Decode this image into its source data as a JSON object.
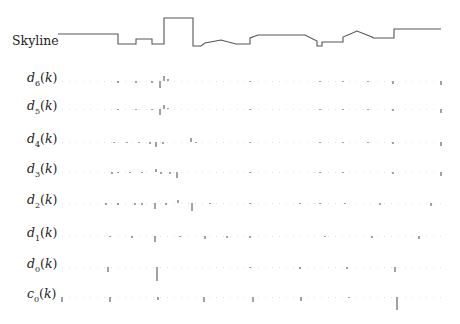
{
  "figure": {
    "skyline_label": "Skyline",
    "rows": [
      {
        "key": "d6",
        "base": "d",
        "sub": "6",
        "arg": "(k)",
        "y": 81
      },
      {
        "key": "d5",
        "base": "d",
        "sub": "5",
        "arg": "(k)",
        "y": 109
      },
      {
        "key": "d4",
        "base": "d",
        "sub": "4",
        "arg": "(k)",
        "y": 142
      },
      {
        "key": "d3",
        "base": "d",
        "sub": "3",
        "arg": "(k)",
        "y": 172
      },
      {
        "key": "d2",
        "base": "d",
        "sub": "2",
        "arg": "(k)",
        "y": 203
      },
      {
        "key": "d1",
        "base": "d",
        "sub": "1",
        "arg": "(k)",
        "y": 236
      },
      {
        "key": "d0",
        "base": "d",
        "sub": "0",
        "arg": "(k)",
        "y": 267
      },
      {
        "key": "c0",
        "base": "c",
        "sub": "0",
        "arg": "(k)",
        "y": 297
      }
    ]
  },
  "chart_data": {
    "type": "line",
    "title": "",
    "skyline": [
      [
        58,
        34
      ],
      [
        118,
        34
      ],
      [
        118,
        44
      ],
      [
        136,
        44
      ],
      [
        136,
        39
      ],
      [
        152,
        39
      ],
      [
        152,
        44
      ],
      [
        164,
        44
      ],
      [
        164,
        18
      ],
      [
        193,
        18
      ],
      [
        193,
        46
      ],
      [
        201,
        46
      ],
      [
        205,
        43
      ],
      [
        221,
        40
      ],
      [
        236,
        44
      ],
      [
        250,
        44
      ],
      [
        250,
        38
      ],
      [
        258,
        35
      ],
      [
        305,
        35
      ],
      [
        317,
        41
      ],
      [
        317,
        46
      ],
      [
        322,
        46
      ],
      [
        322,
        42
      ],
      [
        343,
        42
      ],
      [
        343,
        37
      ],
      [
        357,
        31
      ],
      [
        372,
        37
      ],
      [
        373,
        38
      ],
      [
        394,
        38
      ],
      [
        394,
        29
      ],
      [
        441,
        29
      ]
    ],
    "stems": {
      "d6": [
        [
          118,
          -2
        ],
        [
          136,
          -2
        ],
        [
          152,
          -2
        ],
        [
          160,
          -7
        ],
        [
          164,
          5
        ],
        [
          168,
          2
        ],
        [
          250,
          -1
        ],
        [
          320,
          -1
        ],
        [
          343,
          -1
        ],
        [
          368,
          -1
        ],
        [
          393,
          -3
        ],
        [
          441,
          -4
        ]
      ],
      "d5": [
        [
          118,
          -1
        ],
        [
          136,
          -1
        ],
        [
          152,
          -1
        ],
        [
          160,
          -6
        ],
        [
          164,
          4
        ],
        [
          168,
          1
        ],
        [
          250,
          -1
        ],
        [
          320,
          -1
        ],
        [
          343,
          -1
        ],
        [
          368,
          -1
        ],
        [
          393,
          -2
        ],
        [
          441,
          -4
        ]
      ],
      "d4": [
        [
          114,
          -1
        ],
        [
          127,
          -1
        ],
        [
          139,
          -1
        ],
        [
          150,
          -2
        ],
        [
          156,
          -5
        ],
        [
          163,
          -2
        ],
        [
          191,
          4
        ],
        [
          196,
          -1
        ],
        [
          250,
          -1
        ],
        [
          320,
          -1
        ],
        [
          343,
          -1
        ],
        [
          368,
          -1
        ],
        [
          393,
          -2
        ],
        [
          441,
          -4
        ]
      ],
      "d3": [
        [
          112,
          -2
        ],
        [
          118,
          -1
        ],
        [
          130,
          -1
        ],
        [
          142,
          -1
        ],
        [
          156,
          3
        ],
        [
          161,
          -2
        ],
        [
          170,
          -2
        ],
        [
          177,
          -6
        ],
        [
          250,
          -1
        ],
        [
          320,
          -1
        ],
        [
          343,
          -1
        ],
        [
          393,
          -2
        ],
        [
          441,
          -4
        ]
      ],
      "d2": [
        [
          106,
          -2
        ],
        [
          118,
          -2
        ],
        [
          135,
          -2
        ],
        [
          142,
          -2
        ],
        [
          155,
          -6
        ],
        [
          166,
          -2
        ],
        [
          178,
          3
        ],
        [
          192,
          -8
        ],
        [
          210,
          -1
        ],
        [
          250,
          -1
        ],
        [
          300,
          -1
        ],
        [
          320,
          -1
        ],
        [
          345,
          -1
        ],
        [
          380,
          -2
        ],
        [
          431,
          -3
        ]
      ],
      "d1": [
        [
          110,
          -1
        ],
        [
          132,
          -2
        ],
        [
          155,
          -6
        ],
        [
          180,
          -1
        ],
        [
          205,
          -3
        ],
        [
          227,
          -2
        ],
        [
          250,
          -2
        ],
        [
          325,
          -1
        ],
        [
          372,
          -2
        ],
        [
          419,
          -3
        ]
      ],
      "d0": [
        [
          108,
          -5
        ],
        [
          157,
          -14
        ],
        [
          250,
          -1
        ],
        [
          300,
          -2
        ],
        [
          347,
          -2
        ],
        [
          395,
          -5
        ]
      ],
      "c0": [
        [
          62,
          -5
        ],
        [
          110,
          -5
        ],
        [
          158,
          -3
        ],
        [
          204,
          -5
        ],
        [
          253,
          -5
        ],
        [
          301,
          -4
        ],
        [
          349,
          -1
        ],
        [
          397,
          -13
        ]
      ]
    },
    "xlabel": "",
    "ylabel": ""
  }
}
